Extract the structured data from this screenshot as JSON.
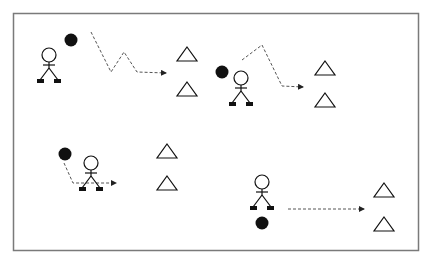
{
  "diagram": {
    "type": "hockey-drill",
    "frame": {
      "x": 13,
      "y": 13,
      "width": 406,
      "height": 238,
      "stroke": "#7a7a7a"
    },
    "colors": {
      "ink": "#111111",
      "path": "#555555",
      "background": "#ffffff"
    },
    "drills": [
      {
        "id": "drill-1",
        "player": {
          "x": 49,
          "y": 55
        },
        "puck": {
          "x": 71,
          "y": 40
        },
        "path": "91,32 111,72 124,52 137,72 166,73",
        "path_style": "dashed-zigzag-arrow",
        "cones": [
          {
            "x": 187,
            "y": 54
          },
          {
            "x": 187,
            "y": 89
          }
        ]
      },
      {
        "id": "drill-2",
        "player": {
          "x": 241,
          "y": 78
        },
        "puck": {
          "x": 222,
          "y": 72
        },
        "path": "242,60 262,45 282,86 303,87",
        "path_style": "dashed-arrow",
        "cones": [
          {
            "x": 325,
            "y": 68
          },
          {
            "x": 325,
            "y": 100
          }
        ]
      },
      {
        "id": "drill-3",
        "player": {
          "x": 91,
          "y": 163
        },
        "puck": {
          "x": 65,
          "y": 154
        },
        "path": "64,163 73,183 116,183",
        "path_style": "dashed-arrow",
        "cones": [
          {
            "x": 167,
            "y": 151
          },
          {
            "x": 167,
            "y": 183
          }
        ]
      },
      {
        "id": "drill-4",
        "player": {
          "x": 262,
          "y": 182
        },
        "puck": {
          "x": 262,
          "y": 223
        },
        "path": "288,209 364,209",
        "path_style": "dashed-arrow",
        "cones": [
          {
            "x": 384,
            "y": 190
          },
          {
            "x": 384,
            "y": 224
          }
        ]
      }
    ]
  }
}
